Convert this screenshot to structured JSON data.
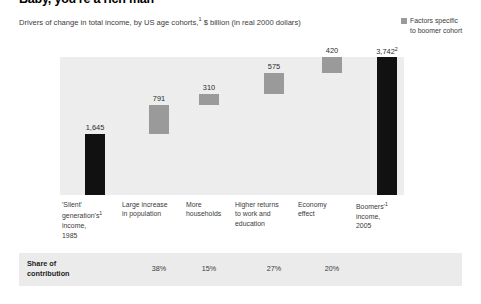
{
  "header": {
    "title": "Baby, you're a rich man",
    "subtitle_pre": "Drivers of change in total income, by US age cohorts,",
    "subtitle_sup": "1",
    "subtitle_post": " $ billion (in real 2000 dollars)"
  },
  "legend": {
    "swatch_color": "#9a9a9a",
    "label_line1": "Factors specific",
    "label_line2": "to boomer cohort"
  },
  "colors": {
    "dark_bar": "#111111",
    "gray_bar": "#9a9a9a",
    "plot_background": "#ededed",
    "band_background": "#ebebeb"
  },
  "share": {
    "label_line1": "Share of",
    "label_line2": "contribution",
    "values": [
      "38%",
      "15%",
      "27%",
      "20%"
    ]
  },
  "chart_data": {
    "type": "bar",
    "subtype": "waterfall",
    "title": "Baby, you're a rich man",
    "subtitle": "Drivers of change in total income, by US age cohorts,1 $ billion (in real 2000 dollars)",
    "xlabel": "",
    "ylabel": "$ billion (in real 2000 dollars)",
    "ylim": [
      0,
      3742
    ],
    "grid": false,
    "legend_position": "top-right",
    "legend_entries": [
      "Factors specific to boomer cohort"
    ],
    "categories": [
      "'Silent' generation's1 income, 1985",
      "Large increase in population",
      "More households",
      "Higher returns to work and education",
      "Economy effect",
      "Boomers'1 income, 2005"
    ],
    "category_lines": [
      [
        "'Silent'",
        "generation's",
        "income,",
        "1985"
      ],
      [
        "Large increase",
        "in population"
      ],
      [
        "More",
        "households"
      ],
      [
        "Higher returns",
        "to work and",
        "education"
      ],
      [
        "Economy",
        "effect"
      ],
      [
        "Boomers'",
        "income,",
        "2005"
      ]
    ],
    "values": [
      1645,
      791,
      310,
      575,
      420,
      3742
    ],
    "value_labels": [
      "1,645",
      "791",
      "310",
      "575",
      "420",
      "3,742"
    ],
    "value_label_sups": [
      "",
      "",
      "",
      "",
      "",
      "2"
    ],
    "bar_kinds": [
      "total",
      "delta",
      "delta",
      "delta",
      "delta",
      "total"
    ],
    "bar_colors": [
      "#111111",
      "#9a9a9a",
      "#9a9a9a",
      "#9a9a9a",
      "#111111",
      "#111111"
    ],
    "cumulative_base": [
      0,
      1645,
      2436,
      2746,
      3321,
      0
    ],
    "cumulative_top": [
      1645,
      2436,
      2746,
      3321,
      3741,
      3742
    ],
    "share_of_contribution": [
      null,
      "38%",
      "15%",
      "27%",
      "20%",
      null
    ]
  }
}
